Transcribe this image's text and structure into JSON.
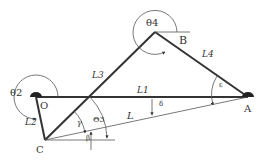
{
  "diagram": {
    "type": "four-bar linkage",
    "points": {
      "O": {
        "label": "O",
        "x": 36,
        "y": 97
      },
      "A": {
        "label": "A",
        "x": 248,
        "y": 97
      },
      "B": {
        "label": "B",
        "x": 155,
        "y": 32
      },
      "C": {
        "label": "C",
        "x": 45,
        "y": 140
      }
    },
    "links": {
      "L1": "L1",
      "L2": "L2",
      "L3": "L3",
      "L4": "L4",
      "L": "L"
    },
    "angles": {
      "theta2": "θ2",
      "theta4": "θ4",
      "theta3": "Θ3",
      "gamma": "γ",
      "beta": "β",
      "delta": "δ",
      "epsilon": "ε"
    },
    "colors": {
      "link": "#333333",
      "thin": "#555555",
      "background": "#ffffff"
    }
  }
}
